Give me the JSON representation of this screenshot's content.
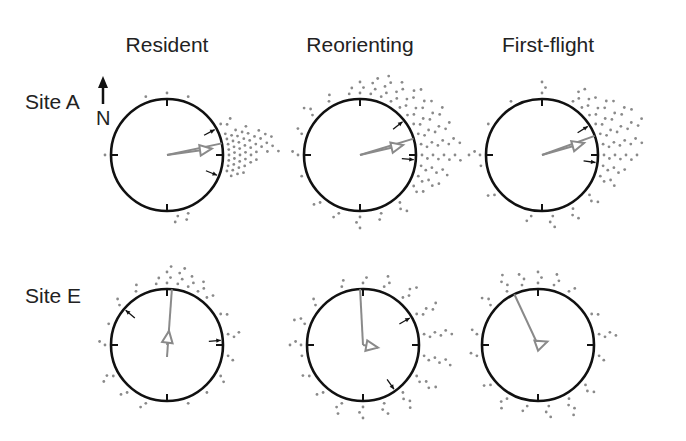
{
  "figure": {
    "columns": [
      "Resident",
      "Reorienting",
      "First-flight"
    ],
    "rows": [
      "Site A",
      "Site E"
    ],
    "north_label": "N"
  },
  "colors": {
    "circle": "#111111",
    "mean_vector": "#8a8a8a",
    "dots": "#8a8a8a",
    "ci_arrows": "#111111",
    "background": "#ffffff"
  },
  "chart_data": {
    "type": "circular-dot-plot",
    "title": "",
    "column_labels": [
      "Resident",
      "Reorienting",
      "First-flight"
    ],
    "row_labels": [
      "Site A",
      "Site E"
    ],
    "north_indicator": "N (up)",
    "panels": [
      {
        "row": "Site A",
        "col": "Resident",
        "cx": 167,
        "cy": 155,
        "mean_angle_deg": 82,
        "mean_r": 0.95,
        "ci_deg": [
          62,
          112
        ],
        "dot_bins": [
          [
            0,
            1
          ],
          [
            20,
            1
          ],
          [
            340,
            1
          ],
          [
            60,
            3
          ],
          [
            70,
            5
          ],
          [
            75,
            8
          ],
          [
            80,
            9
          ],
          [
            85,
            10
          ],
          [
            90,
            6
          ],
          [
            95,
            5
          ],
          [
            100,
            4
          ],
          [
            105,
            3
          ],
          [
            160,
            2
          ],
          [
            170,
            2
          ],
          [
            270,
            1
          ]
        ]
      },
      {
        "row": "Site A",
        "col": "Reorienting",
        "cx": 360,
        "cy": 155,
        "mean_angle_deg": 77,
        "mean_r": 0.93,
        "ci_deg": [
          52,
          95
        ],
        "dot_bins": [
          [
            0,
            3
          ],
          [
            10,
            4
          ],
          [
            20,
            5
          ],
          [
            30,
            5
          ],
          [
            40,
            6
          ],
          [
            50,
            6
          ],
          [
            60,
            7
          ],
          [
            70,
            7
          ],
          [
            80,
            8
          ],
          [
            90,
            8
          ],
          [
            100,
            6
          ],
          [
            110,
            5
          ],
          [
            120,
            3
          ],
          [
            140,
            3
          ],
          [
            160,
            2
          ],
          [
            180,
            3
          ],
          [
            200,
            2
          ],
          [
            220,
            2
          ],
          [
            250,
            1
          ],
          [
            270,
            2
          ],
          [
            290,
            2
          ],
          [
            310,
            3
          ],
          [
            330,
            2
          ],
          [
            350,
            2
          ]
        ]
      },
      {
        "row": "Site A",
        "col": "First-flight",
        "cx": 542,
        "cy": 155,
        "mean_angle_deg": 74,
        "mean_r": 0.92,
        "ci_deg": [
          58,
          98
        ],
        "dot_bins": [
          [
            0,
            3
          ],
          [
            30,
            4
          ],
          [
            40,
            4
          ],
          [
            50,
            6
          ],
          [
            60,
            8
          ],
          [
            70,
            9
          ],
          [
            80,
            8
          ],
          [
            90,
            7
          ],
          [
            100,
            5
          ],
          [
            110,
            4
          ],
          [
            130,
            3
          ],
          [
            150,
            3
          ],
          [
            170,
            3
          ],
          [
            190,
            2
          ],
          [
            230,
            2
          ],
          [
            260,
            1
          ],
          [
            270,
            3
          ],
          [
            300,
            1
          ],
          [
            330,
            1
          ]
        ]
      },
      {
        "row": "Site E",
        "col": "Resident",
        "cx": 167,
        "cy": 345,
        "mean_angle_deg": 8,
        "mean_r": 0.3,
        "ci_deg": [
          310,
          85
        ],
        "dot_bins": [
          [
            0,
            4
          ],
          [
            10,
            4
          ],
          [
            20,
            3
          ],
          [
            30,
            3
          ],
          [
            40,
            2
          ],
          [
            60,
            2
          ],
          [
            80,
            3
          ],
          [
            100,
            2
          ],
          [
            120,
            2
          ],
          [
            140,
            1
          ],
          [
            160,
            1
          ],
          [
            200,
            2
          ],
          [
            220,
            2
          ],
          [
            240,
            3
          ],
          [
            270,
            2
          ],
          [
            290,
            1
          ],
          [
            310,
            2
          ],
          [
            330,
            2
          ],
          [
            350,
            2
          ]
        ]
      },
      {
        "row": "Site E",
        "col": "Reorienting",
        "cx": 363,
        "cy": 345,
        "mean_angle_deg": 100,
        "mean_r": 0.32,
        "ci_deg": [
          60,
          145
        ],
        "dot_bins": [
          [
            0,
            2
          ],
          [
            20,
            3
          ],
          [
            40,
            4
          ],
          [
            60,
            5
          ],
          [
            80,
            6
          ],
          [
            100,
            6
          ],
          [
            120,
            5
          ],
          [
            140,
            4
          ],
          [
            160,
            3
          ],
          [
            180,
            3
          ],
          [
            200,
            3
          ],
          [
            220,
            2
          ],
          [
            240,
            2
          ],
          [
            260,
            1
          ],
          [
            270,
            3
          ],
          [
            290,
            3
          ],
          [
            310,
            2
          ],
          [
            340,
            2
          ]
        ]
      },
      {
        "row": "Site E",
        "col": "First-flight",
        "cx": 538,
        "cy": 345,
        "mean_angle_deg": 70,
        "mean_r": 0.08,
        "ci_deg": [],
        "dot_bins": [
          [
            0,
            3
          ],
          [
            15,
            3
          ],
          [
            30,
            2
          ],
          [
            60,
            2
          ],
          [
            80,
            4
          ],
          [
            100,
            2
          ],
          [
            130,
            3
          ],
          [
            150,
            4
          ],
          [
            170,
            3
          ],
          [
            190,
            2
          ],
          [
            210,
            3
          ],
          [
            230,
            2
          ],
          [
            260,
            2
          ],
          [
            280,
            2
          ],
          [
            310,
            3
          ],
          [
            330,
            4
          ],
          [
            345,
            3
          ]
        ]
      }
    ]
  },
  "layout": {
    "radius": 56,
    "col_x": [
      167,
      360,
      542
    ],
    "row_y": [
      155,
      345
    ],
    "col_title_y": 52,
    "row_title_x": 24
  }
}
